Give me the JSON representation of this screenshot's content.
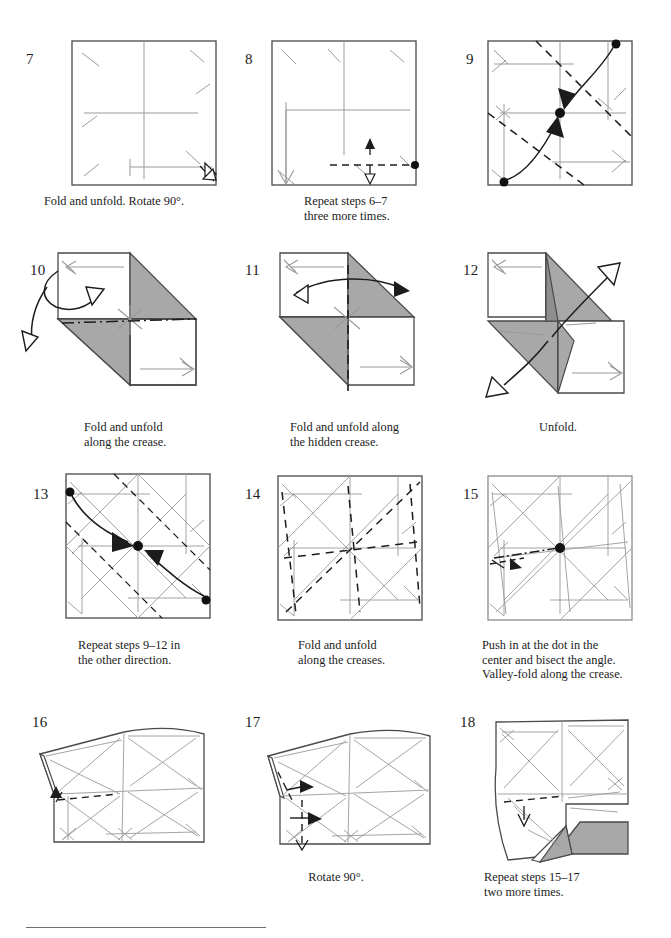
{
  "page": {
    "background": "#ffffff",
    "ink_color": "#1c1c1c",
    "crease_gray": "#9a9a9a",
    "paper_gray_fill": "#a8a8a8",
    "footer_rule": {
      "label": "footer-rule"
    }
  },
  "steps": [
    {
      "number": "7",
      "caption": "Fold and unfold. Rotate 90°.",
      "caption_lines": [
        "Fold and unfold. Rotate 90°."
      ]
    },
    {
      "number": "8",
      "caption": "Repeat steps 6–7\nthree more times.",
      "caption_lines": [
        "Repeat steps 6–7",
        "three more times."
      ]
    },
    {
      "number": "9",
      "caption": "",
      "caption_lines": []
    },
    {
      "number": "10",
      "caption": "Fold and unfold\nalong the crease.",
      "caption_lines": [
        "Fold and unfold",
        "along the crease."
      ]
    },
    {
      "number": "11",
      "caption": "Fold and unfold along\nthe hidden crease.",
      "caption_lines": [
        "Fold and unfold along",
        "the hidden crease."
      ]
    },
    {
      "number": "12",
      "caption": "Unfold.",
      "caption_lines": [
        "Unfold."
      ]
    },
    {
      "number": "13",
      "caption": "Repeat steps 9–12 in\nthe other direction.",
      "caption_lines": [
        "Repeat steps 9–12 in",
        "the other direction."
      ]
    },
    {
      "number": "14",
      "caption": "Fold and unfold\nalong the creases.",
      "caption_lines": [
        "Fold and unfold",
        "along the creases."
      ]
    },
    {
      "number": "15",
      "caption": "Push in at the dot in the\ncenter and bisect the angle.\nValley-fold along the crease.",
      "caption_lines": [
        "Push in at the dot in the",
        "center and bisect the angle.",
        "Valley-fold along the crease."
      ]
    },
    {
      "number": "16",
      "caption": "",
      "caption_lines": []
    },
    {
      "number": "17",
      "caption": "Rotate 90°.",
      "caption_lines": [
        "Rotate 90°."
      ]
    },
    {
      "number": "18",
      "caption": "Repeat steps 15–17\ntwo more times.",
      "caption_lines": [
        "Repeat steps 15–17",
        "two more times."
      ]
    }
  ]
}
